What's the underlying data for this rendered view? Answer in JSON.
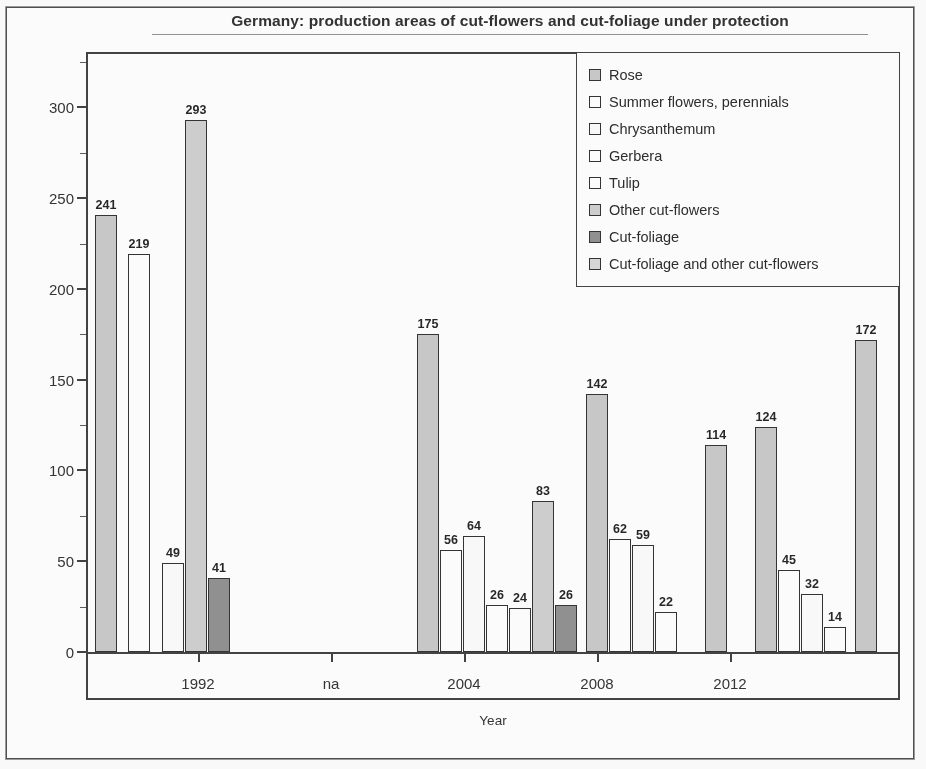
{
  "chart_data": {
    "type": "bar",
    "title": "Germany: production areas of cut-flowers and cut-foliage under protection",
    "xlabel": "Year",
    "ylabel": "Area (ha)",
    "ylim": [
      0,
      325
    ],
    "ytick_labels": [
      "0",
      "50",
      "100",
      "150",
      "200",
      "250",
      "300"
    ],
    "ytick_values": [
      0,
      50,
      100,
      150,
      200,
      250,
      300
    ],
    "yminor_step": 25,
    "grid": false,
    "legend_position": "top-right",
    "xtick_labels": [
      "1992",
      "na",
      "2004",
      "2008",
      "2012"
    ],
    "series": [
      {
        "name": "Rose",
        "color": "#c8c8c8"
      },
      {
        "name": "Summer flowers, perennials",
        "color": "#ffffff"
      },
      {
        "name": "Chrysanthemum",
        "color": "#fcfcfc"
      },
      {
        "name": "Gerbera",
        "color": "#ffffff"
      },
      {
        "name": "Tulip",
        "color": "#ffffff"
      },
      {
        "name": "Other cut-flowers",
        "color": "#cfcfcf"
      },
      {
        "name": "Cut-foliage",
        "color": "#8e8e8e"
      },
      {
        "name": "Cut-foliage and other cut-flowers",
        "color": "#d8d8d8"
      }
    ],
    "groups": [
      {
        "label": "1992",
        "bars": [
          {
            "series": "Rose",
            "value": 241
          },
          {
            "series": "Summer flowers, perennials",
            "value": 219
          },
          {
            "series": "Gerbera",
            "value": 49
          },
          {
            "series": "Other cut-flowers",
            "value": 293
          },
          {
            "series": "Cut-foliage",
            "value": 41
          }
        ]
      },
      {
        "label": "2004",
        "bars": [
          {
            "series": "Rose",
            "value": 175
          },
          {
            "series": "Summer flowers, perennials",
            "value": 56
          },
          {
            "series": "Chrysanthemum",
            "value": 64
          },
          {
            "series": "Gerbera",
            "value": 26
          },
          {
            "series": "Tulip",
            "value": 24
          },
          {
            "series": "Other cut-flowers",
            "value": 83
          },
          {
            "series": "Cut-foliage",
            "value": 26
          }
        ]
      },
      {
        "label": "2008",
        "bars": [
          {
            "series": "Rose",
            "value": 142
          },
          {
            "series": "Summer flowers, perennials",
            "value": 62
          },
          {
            "series": "Chrysanthemum",
            "value": 59
          },
          {
            "series": "Gerbera",
            "value": 22
          }
        ]
      },
      {
        "label": "2010",
        "bars": [
          {
            "series": "Rose",
            "value": 114
          }
        ]
      },
      {
        "label": "2012",
        "bars": [
          {
            "series": "Rose",
            "value": 124
          },
          {
            "series": "Summer flowers, perennials",
            "value": 45
          },
          {
            "series": "Chrysanthemum",
            "value": 32
          },
          {
            "series": "Gerbera",
            "value": 14
          }
        ]
      },
      {
        "label": "2014",
        "bars": [
          {
            "series": "Rose",
            "value": 172
          }
        ]
      }
    ],
    "bar_layout": [
      {
        "value": 241,
        "color": "#c8c8c8",
        "x": 9,
        "w": 22,
        "label_dy": -19
      },
      {
        "value": 219,
        "color": "#ffffff",
        "x": 42,
        "w": 22,
        "label_dy": -19
      },
      {
        "value": 49,
        "color": "#fcfcfc",
        "x": 76,
        "w": 22,
        "label_dy": -19
      },
      {
        "value": 293,
        "color": "#cfcfcf",
        "x": 99,
        "w": 22,
        "label_dy": -19
      },
      {
        "value": 41,
        "color": "#8e8e8e",
        "x": 122,
        "w": 22,
        "label_dy": -19
      },
      {
        "value": 175,
        "color": "#c8c8c8",
        "x": 331,
        "w": 22,
        "label_dy": -19
      },
      {
        "value": 56,
        "color": "#ffffff",
        "x": 354,
        "w": 22,
        "label_dy": -19
      },
      {
        "value": 64,
        "color": "#fcfcfc",
        "x": 377,
        "w": 22,
        "label_dy": -19
      },
      {
        "value": 26,
        "color": "#ffffff",
        "x": 400,
        "w": 22,
        "label_dy": -19
      },
      {
        "value": 24,
        "color": "#ffffff",
        "x": 423,
        "w": 22,
        "label_dy": -19
      },
      {
        "value": 83,
        "color": "#cfcfcf",
        "x": 446,
        "w": 22,
        "label_dy": -19
      },
      {
        "value": 26,
        "color": "#8e8e8e",
        "x": 469,
        "w": 22,
        "label_dy": -19
      },
      {
        "value": 142,
        "color": "#c8c8c8",
        "x": 500,
        "w": 22,
        "label_dy": -19
      },
      {
        "value": 62,
        "color": "#ffffff",
        "x": 523,
        "w": 22,
        "label_dy": -19
      },
      {
        "value": 59,
        "color": "#fcfcfc",
        "x": 546,
        "w": 22,
        "label_dy": -19
      },
      {
        "value": 22,
        "color": "#ffffff",
        "x": 569,
        "w": 22,
        "label_dy": -19
      },
      {
        "value": 114,
        "color": "#c8c8c8",
        "x": 619,
        "w": 22,
        "label_dy": -19
      },
      {
        "value": 124,
        "color": "#c8c8c8",
        "x": 669,
        "w": 22,
        "label_dy": -19
      },
      {
        "value": 45,
        "color": "#ffffff",
        "x": 692,
        "w": 22,
        "label_dy": -19
      },
      {
        "value": 32,
        "color": "#fcfcfc",
        "x": 715,
        "w": 22,
        "label_dy": -19
      },
      {
        "value": 14,
        "color": "#ffffff",
        "x": 738,
        "w": 22,
        "label_dy": -19
      },
      {
        "value": 172,
        "color": "#c8c8c8",
        "x": 769,
        "w": 22,
        "label_dy": -19
      }
    ],
    "xtick_layout": [
      {
        "label": "1992",
        "x": 112
      },
      {
        "label": "na",
        "x": 245
      },
      {
        "label": "2004",
        "x": 378
      },
      {
        "label": "2008",
        "x": 511
      },
      {
        "label": "2012",
        "x": 644
      }
    ]
  }
}
